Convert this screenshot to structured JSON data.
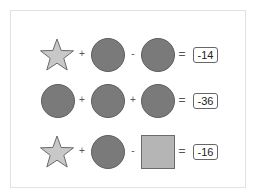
{
  "puzzle": {
    "rows": [
      {
        "shapes": [
          "star",
          "circle",
          "circle"
        ],
        "operators": [
          "+",
          "-"
        ],
        "equals": "=",
        "result": "-14"
      },
      {
        "shapes": [
          "circle",
          "circle",
          "circle"
        ],
        "operators": [
          "+",
          "+"
        ],
        "equals": "=",
        "result": "-36"
      },
      {
        "shapes": [
          "star",
          "circle",
          "square"
        ],
        "operators": [
          "+",
          "-"
        ],
        "equals": "=",
        "result": "-16"
      }
    ],
    "colors": {
      "star_fill": "#c8c8c8",
      "star_stroke": "#6a6a6a",
      "circle_fill": "#7a7a7a",
      "square_fill": "#b5b5b5"
    }
  }
}
